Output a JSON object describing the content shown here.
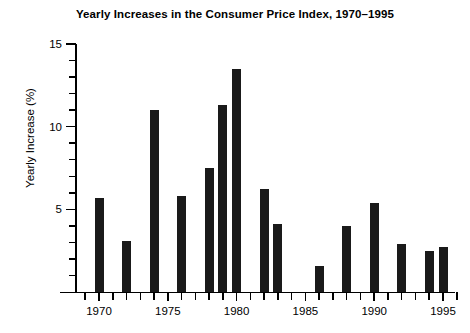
{
  "chart_data": {
    "type": "bar",
    "title": "Yearly Increases in the Consumer Price Index, 1970–1995",
    "xlabel": "",
    "ylabel": "Yearly Increase (%)",
    "xlim": [
      1968.5,
      1996.5
    ],
    "ylim": [
      0,
      15.8
    ],
    "grid": false,
    "legend": null,
    "y_ticks_major": [
      5,
      10,
      15
    ],
    "y_tick_labels": [
      "5",
      "10",
      "15"
    ],
    "y_ticks_minor": [
      1,
      2,
      3,
      4,
      6,
      7,
      8,
      9,
      11,
      12,
      13,
      14
    ],
    "x_ticks_major": [
      1970,
      1975,
      1980,
      1985,
      1990,
      1995
    ],
    "x_tick_labels": [
      "1970",
      "1975",
      "1980",
      "1985",
      "1990",
      "1995"
    ],
    "x_ticks_minor": [
      1969,
      1971,
      1972,
      1973,
      1974,
      1976,
      1977,
      1978,
      1979,
      1981,
      1982,
      1983,
      1984,
      1986,
      1987,
      1988,
      1989,
      1991,
      1992,
      1993,
      1994,
      1996
    ],
    "bar_color": "#1a1a1a",
    "categories": [
      1970,
      1972,
      1974,
      1976,
      1978,
      1979,
      1980,
      1982,
      1983,
      1986,
      1988,
      1990,
      1992,
      1994,
      1995
    ],
    "values": [
      5.7,
      3.1,
      11.0,
      5.8,
      7.5,
      11.3,
      13.5,
      6.2,
      4.1,
      1.6,
      4.0,
      5.4,
      2.9,
      2.5,
      2.7
    ],
    "points": [
      {
        "year": 1970,
        "value": 5.7
      },
      {
        "year": 1972,
        "value": 3.1
      },
      {
        "year": 1974,
        "value": 11.0
      },
      {
        "year": 1976,
        "value": 5.8
      },
      {
        "year": 1978,
        "value": 7.5
      },
      {
        "year": 1979,
        "value": 11.3
      },
      {
        "year": 1980,
        "value": 13.5
      },
      {
        "year": 1982,
        "value": 6.2
      },
      {
        "year": 1983,
        "value": 4.1
      },
      {
        "year": 1986,
        "value": 1.6
      },
      {
        "year": 1988,
        "value": 4.0
      },
      {
        "year": 1990,
        "value": 5.4
      },
      {
        "year": 1992,
        "value": 2.9
      },
      {
        "year": 1994,
        "value": 2.5
      },
      {
        "year": 1995,
        "value": 2.7
      }
    ]
  }
}
